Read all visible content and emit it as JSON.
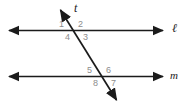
{
  "figure": {
    "canvas": {
      "width": 188,
      "height": 110,
      "background": "#ffffff"
    },
    "stroke_color": "#1b1b1b",
    "label_color": "#8d8d8d",
    "line_label_color": "#1b1b1b",
    "lines": [
      {
        "name": "line-l",
        "label": "ℓ",
        "y": 30.5,
        "x1": 6,
        "x2": 166,
        "arrows": "both"
      },
      {
        "name": "line-m",
        "label": "m",
        "y": 76.5,
        "x1": 6,
        "x2": 166,
        "arrows": "both"
      },
      {
        "name": "transversal-t",
        "label": "t",
        "x1": 58,
        "y1": 6,
        "x2": 119,
        "y2": 104,
        "arrows": "both"
      }
    ],
    "intersections": [
      {
        "name": "upper-intersection",
        "x": 76,
        "y": 30.5
      },
      {
        "name": "lower-intersection",
        "x": 104,
        "y": 76.5
      }
    ],
    "angle_labels": [
      {
        "name": "angle-label-1",
        "text": "1",
        "x": 59,
        "y": 20
      },
      {
        "name": "angle-label-2",
        "text": "2",
        "x": 78,
        "y": 20
      },
      {
        "name": "angle-label-4",
        "text": "4",
        "x": 65,
        "y": 33
      },
      {
        "name": "angle-label-3",
        "text": "3",
        "x": 83,
        "y": 33
      },
      {
        "name": "angle-label-5",
        "text": "5",
        "x": 87,
        "y": 66
      },
      {
        "name": "angle-label-6",
        "text": "6",
        "x": 106,
        "y": 66
      },
      {
        "name": "angle-label-8",
        "text": "8",
        "x": 93,
        "y": 79
      },
      {
        "name": "angle-label-7",
        "text": "7",
        "x": 111,
        "y": 79
      }
    ],
    "line_labels": [
      {
        "name": "line-label-t",
        "text": "t",
        "x": 74,
        "y": 3
      },
      {
        "name": "line-label-l",
        "text": "ℓ",
        "x": 172,
        "y": 23
      },
      {
        "name": "line-label-m",
        "text": "m",
        "x": 170,
        "y": 70
      }
    ]
  }
}
